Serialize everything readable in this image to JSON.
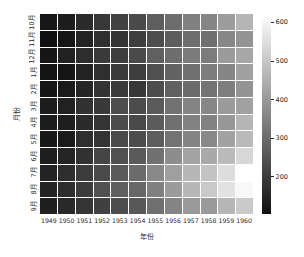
{
  "chart_data": {
    "type": "heatmap",
    "title": "",
    "xlabel": "年份",
    "ylabel": "月份",
    "colormap": "grayscale (dark = low, light = high)",
    "colorbar": {
      "label": "",
      "ticks": [
        200,
        300,
        400,
        500,
        600
      ],
      "vmin": 104,
      "vmax": 622,
      "low_color": "#101010",
      "high_color": "#ffffff"
    },
    "grid": true,
    "gridline_color": "#ffffff",
    "x_categories": [
      "1949",
      "1950",
      "1951",
      "1952",
      "1953",
      "1954",
      "1955",
      "1956",
      "1957",
      "1958",
      "1959",
      "1960"
    ],
    "y_categories": [
      "10月",
      "11月",
      "12月",
      "1月",
      "2月",
      "3月",
      "4月",
      "5月",
      "6月",
      "7月",
      "8月",
      "9月"
    ],
    "values": [
      [
        119,
        133,
        162,
        191,
        211,
        229,
        274,
        306,
        347,
        359,
        407,
        461
      ],
      [
        104,
        114,
        146,
        172,
        180,
        203,
        237,
        271,
        305,
        310,
        362,
        390
      ],
      [
        118,
        140,
        166,
        194,
        201,
        229,
        278,
        306,
        336,
        337,
        405,
        432
      ],
      [
        112,
        115,
        145,
        171,
        196,
        204,
        242,
        284,
        315,
        340,
        360,
        417
      ],
      [
        118,
        126,
        150,
        180,
        196,
        188,
        233,
        277,
        301,
        318,
        342,
        391
      ],
      [
        132,
        141,
        178,
        193,
        236,
        235,
        267,
        317,
        356,
        362,
        406,
        419
      ],
      [
        129,
        135,
        163,
        181,
        235,
        227,
        269,
        313,
        348,
        348,
        396,
        461
      ],
      [
        121,
        125,
        172,
        183,
        229,
        234,
        270,
        318,
        355,
        363,
        420,
        472
      ],
      [
        135,
        149,
        178,
        218,
        243,
        264,
        315,
        374,
        422,
        435,
        472,
        535
      ],
      [
        148,
        170,
        199,
        230,
        264,
        302,
        364,
        413,
        465,
        491,
        548,
        622
      ],
      [
        148,
        170,
        199,
        242,
        272,
        293,
        347,
        405,
        467,
        505,
        559,
        606
      ],
      [
        136,
        158,
        184,
        209,
        237,
        259,
        312,
        355,
        404,
        404,
        463,
        508
      ]
    ]
  }
}
